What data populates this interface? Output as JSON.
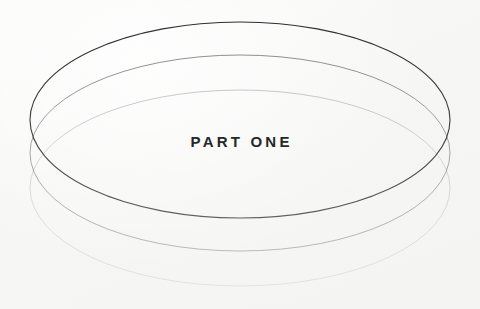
{
  "page": {
    "kind": "book-part-divider",
    "background_color": "#f8f8f7",
    "width": 480,
    "height": 309
  },
  "label": {
    "text": "PART ONE",
    "color": "#272727",
    "letter_spacing_px": 3.2,
    "font_size_px": 15,
    "weight": "bold",
    "align": "center",
    "center_x": 240,
    "baseline_y": 154
  },
  "artwork": {
    "name": "stacked-ellipse-disc",
    "description": "Three identical concentric outline ellipses stacked vertically with decreasing opacity, forming a disc with a fading reflection.",
    "stroke_color": "#3a3a3a",
    "ellipse_width": 420,
    "ellipse_height": 196,
    "center_x": 240,
    "vertical_offset": 32,
    "ellipses": [
      {
        "id": "ellipse-top",
        "center_y": 120,
        "top_y": 22,
        "bottom_y": 218,
        "left_x": 30,
        "right_x": 450,
        "opacity": 0.92,
        "stroke_width": 1.1
      },
      {
        "id": "ellipse-middle",
        "center_y": 153,
        "top_y": 55,
        "bottom_y": 251,
        "left_x": 30,
        "right_x": 450,
        "opacity": 0.45,
        "stroke_width": 1.0
      },
      {
        "id": "ellipse-bottom",
        "center_y": 188,
        "top_y": 90,
        "bottom_y": 286,
        "left_x": 30,
        "right_x": 450,
        "opacity": 0.2,
        "stroke_width": 1.0
      }
    ]
  }
}
